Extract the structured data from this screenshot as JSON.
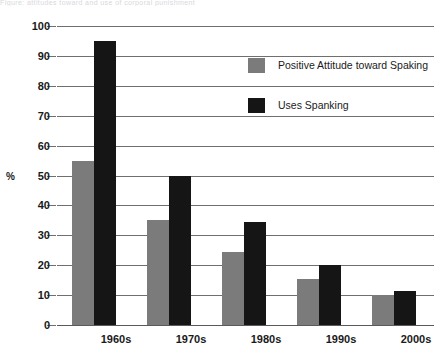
{
  "caption_fragment": "Figure: attitudes toward and use of corporal punishment",
  "chart_data": {
    "type": "bar",
    "title": "",
    "xlabel": "",
    "ylabel": "%",
    "categories": [
      "1960s",
      "1970s",
      "1980s",
      "1990s",
      "2000s"
    ],
    "series": [
      {
        "name": "Positive Attitude toward Spaking",
        "color": "#7b7b7b",
        "values": [
          55,
          35,
          24.5,
          15.5,
          10
        ]
      },
      {
        "name": "Uses Spanking",
        "color": "#151515",
        "values": [
          95,
          50,
          34.5,
          20,
          11.5
        ]
      }
    ],
    "ylim": [
      0,
      100
    ],
    "yticks": [
      0,
      10,
      20,
      30,
      40,
      50,
      60,
      70,
      80,
      90,
      100
    ],
    "ytick_labels": [
      "0",
      "10",
      "20",
      "30",
      "40",
      "50",
      "60",
      "70",
      "80",
      "90",
      "100"
    ],
    "grid": true,
    "legend_position": "upper-right-inside"
  }
}
